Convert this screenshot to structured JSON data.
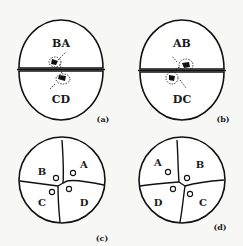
{
  "figure": {
    "panels": [
      {
        "id": "a",
        "caption": "(a)",
        "stage": "two-cell",
        "cells": [
          {
            "label": "BA",
            "position": "top"
          },
          {
            "label": "CD",
            "position": "bottom"
          }
        ]
      },
      {
        "id": "b",
        "caption": "(b)",
        "stage": "two-cell",
        "cells": [
          {
            "label": "AB",
            "position": "top"
          },
          {
            "label": "DC",
            "position": "bottom"
          }
        ]
      },
      {
        "id": "c",
        "caption": "(c)",
        "stage": "four-cell",
        "cells": [
          {
            "label": "B",
            "position": "upper-left"
          },
          {
            "label": "A",
            "position": "upper-right"
          },
          {
            "label": "C",
            "position": "lower-left"
          },
          {
            "label": "D",
            "position": "lower-right"
          }
        ]
      },
      {
        "id": "d",
        "caption": "(d)",
        "stage": "four-cell",
        "cells": [
          {
            "label": "A",
            "position": "upper-left"
          },
          {
            "label": "B",
            "position": "upper-right"
          },
          {
            "label": "D",
            "position": "lower-left"
          },
          {
            "label": "C",
            "position": "lower-right"
          }
        ]
      }
    ]
  },
  "colors": {
    "background": "#f7f7f5",
    "cell_fill": "#ffffff",
    "line": "#111111"
  }
}
